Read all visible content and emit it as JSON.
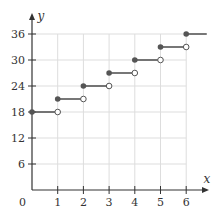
{
  "chart_data": {
    "type": "line",
    "subtype": "step-function",
    "title": "",
    "xlabel": "x",
    "ylabel": "y",
    "xlim": [
      0,
      6.8
    ],
    "ylim": [
      0,
      38
    ],
    "x_ticks": [
      1,
      2,
      3,
      4,
      5,
      6
    ],
    "y_ticks": [
      6,
      12,
      18,
      24,
      30,
      36
    ],
    "origin_label": "0",
    "grid": true,
    "legend": null,
    "steps": [
      {
        "x_start": 0,
        "x_end": 1,
        "y": 18,
        "start": "closed",
        "end": "open"
      },
      {
        "x_start": 1,
        "x_end": 2,
        "y": 21,
        "start": "closed",
        "end": "open"
      },
      {
        "x_start": 2,
        "x_end": 3,
        "y": 24,
        "start": "closed",
        "end": "open"
      },
      {
        "x_start": 3,
        "x_end": 4,
        "y": 27,
        "start": "closed",
        "end": "open"
      },
      {
        "x_start": 4,
        "x_end": 5,
        "y": 30,
        "start": "closed",
        "end": "open"
      },
      {
        "x_start": 5,
        "x_end": 6,
        "y": 33,
        "start": "closed",
        "end": "open"
      },
      {
        "x_start": 6,
        "x_end": 6.8,
        "y": 36,
        "start": "closed",
        "end": "none"
      }
    ],
    "colors": {
      "line": "#555555",
      "grid": "#dddddd",
      "axis": "#333333"
    }
  }
}
